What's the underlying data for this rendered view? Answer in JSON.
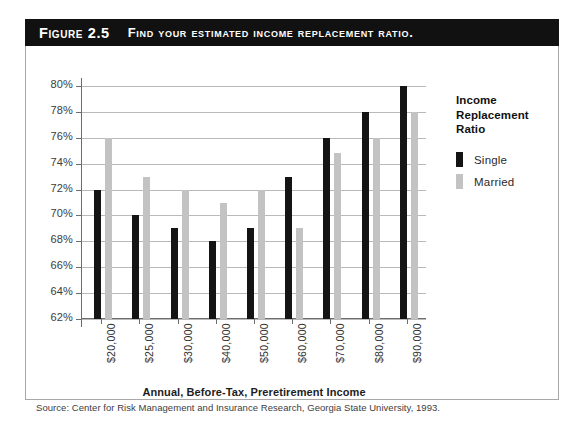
{
  "figure": {
    "label": "Figure 2.5",
    "title": "Find your estimated income replacement ratio.",
    "source": "Source: Center for Risk Management and Insurance Research, Georgia State University, 1993."
  },
  "legend": {
    "title_line1": "Income",
    "title_line2": "Replacement",
    "title_line3": "Ratio",
    "items": [
      {
        "label": "Single",
        "color": "#141414"
      },
      {
        "label": "Married",
        "color": "#c3c3c3"
      }
    ]
  },
  "axis": {
    "x_title": "Annual, Before-Tax, Preretirement Income",
    "y_ticks": [
      "80%",
      "78%",
      "76%",
      "74%",
      "72%",
      "70%",
      "68%",
      "66%",
      "64%",
      "62%"
    ]
  },
  "chart_data": {
    "type": "bar",
    "title": "Find your estimated income replacement ratio.",
    "xlabel": "Annual, Before-Tax, Preretirement Income",
    "ylabel": "Income Replacement Ratio",
    "ylim": [
      60,
      81
    ],
    "ytick_values": [
      80,
      78,
      76,
      74,
      72,
      70,
      68,
      66,
      64,
      62
    ],
    "grid": true,
    "legend_position": "right",
    "categories": [
      "$20,000",
      "$25,000",
      "$30,000",
      "$40,000",
      "$50,000",
      "$60,000",
      "$70,000",
      "$80,000",
      "$90,000"
    ],
    "series": [
      {
        "name": "Single",
        "color": "#141414",
        "values": [
          72,
          70,
          69,
          68,
          69,
          73,
          76,
          78,
          80
        ]
      },
      {
        "name": "Married",
        "color": "#c3c3c3",
        "values": [
          76,
          73,
          72,
          71,
          72,
          69,
          74.8,
          76,
          78
        ]
      }
    ]
  }
}
